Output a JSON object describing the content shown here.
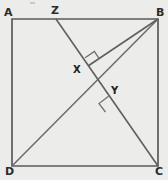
{
  "figure": {
    "type": "geometry-diagram",
    "background_color": "#ececeb",
    "line_color": "#5a5a5a",
    "label_color": "#2b2b2b",
    "width": 168,
    "height": 180
  },
  "labels": {
    "a": "A",
    "b": "B",
    "c": "C",
    "d": "D",
    "x": "X",
    "y": "Y",
    "z": "Z"
  },
  "geometry": {
    "square": {
      "a": {
        "x": 12,
        "y": 19
      },
      "b": {
        "x": 158,
        "y": 19
      },
      "c": {
        "x": 158,
        "y": 166
      },
      "d": {
        "x": 12,
        "y": 166
      }
    },
    "points": {
      "z": {
        "x": 56,
        "y": 19
      },
      "x": {
        "x": 88,
        "y": 66
      },
      "y": {
        "x": 113,
        "y": 103
      }
    },
    "segments": [
      {
        "name": "side-ab",
        "from": "A",
        "to": "B"
      },
      {
        "name": "side-bc",
        "from": "B",
        "to": "C"
      },
      {
        "name": "side-cd",
        "from": "C",
        "to": "D"
      },
      {
        "name": "side-da",
        "from": "D",
        "to": "A"
      },
      {
        "name": "diagonal-db",
        "from": "D",
        "to": "B"
      },
      {
        "name": "cevian-zc",
        "from": "Z",
        "to": "C"
      },
      {
        "name": "segment-xb",
        "from": "X",
        "to": "B"
      }
    ],
    "right_angles": [
      {
        "name": "right-angle-at-x",
        "vertex": "X",
        "between": [
          "XB",
          "ZC"
        ]
      },
      {
        "name": "right-angle-at-y",
        "vertex": "Y",
        "between": [
          "DB",
          "ZC"
        ]
      }
    ]
  },
  "label_positions": {
    "a": {
      "left": 4,
      "top": 7
    },
    "b": {
      "left": 156,
      "top": 7
    },
    "c": {
      "left": 155,
      "top": 166
    },
    "d": {
      "left": 5,
      "top": 166
    },
    "z": {
      "left": 51,
      "top": 5
    },
    "x": {
      "left": 73,
      "top": 65
    },
    "y": {
      "left": 111,
      "top": 86
    }
  }
}
